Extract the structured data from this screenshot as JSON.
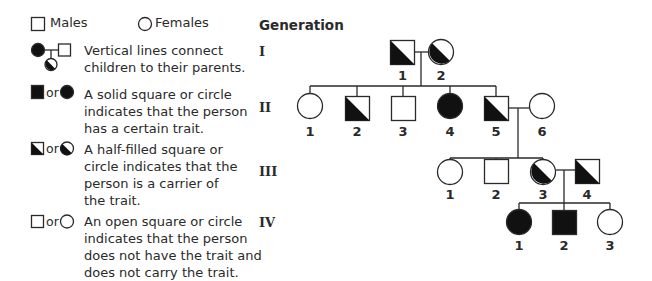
{
  "legend": {
    "males_label": "Males",
    "females_label": "Females",
    "or_text": "or",
    "items": [
      {
        "icon": "parent-child-line-icon",
        "lines": [
          "Vertical lines connect",
          "children to their parents."
        ]
      },
      {
        "icon": "solid-square-or-circle-icon",
        "lines": [
          "A solid square or circle",
          "indicates that the person",
          "has a certain trait."
        ]
      },
      {
        "icon": "half-filled-square-or-circle-icon",
        "lines": [
          "A half-filled square or",
          "circle indicates that the",
          "person is a carrier of",
          "the trait."
        ]
      },
      {
        "icon": "open-square-or-circle-icon",
        "lines": [
          "An open square or circle",
          "indicates that the person",
          "does not have the trait and",
          "does not carry the trait."
        ]
      }
    ]
  },
  "pedigree": {
    "title": "Generation",
    "colors": {
      "stroke": "#2a2a2a",
      "fill": "#111111"
    },
    "generations": [
      {
        "label": "I",
        "members": [
          {
            "id": "1",
            "sex": "male",
            "status": "carrier"
          },
          {
            "id": "2",
            "sex": "female",
            "status": "carrier"
          }
        ]
      },
      {
        "label": "II",
        "members": [
          {
            "id": "1",
            "sex": "female",
            "status": "unaffected"
          },
          {
            "id": "2",
            "sex": "male",
            "status": "carrier"
          },
          {
            "id": "3",
            "sex": "male",
            "status": "unaffected"
          },
          {
            "id": "4",
            "sex": "female",
            "status": "affected"
          },
          {
            "id": "5",
            "sex": "male",
            "status": "carrier"
          },
          {
            "id": "6",
            "sex": "female",
            "status": "unaffected"
          }
        ]
      },
      {
        "label": "III",
        "members": [
          {
            "id": "1",
            "sex": "female",
            "status": "unaffected"
          },
          {
            "id": "2",
            "sex": "male",
            "status": "unaffected"
          },
          {
            "id": "3",
            "sex": "female",
            "status": "carrier"
          },
          {
            "id": "4",
            "sex": "male",
            "status": "carrier"
          }
        ]
      },
      {
        "label": "IV",
        "members": [
          {
            "id": "1",
            "sex": "female",
            "status": "affected"
          },
          {
            "id": "2",
            "sex": "male",
            "status": "affected"
          },
          {
            "id": "3",
            "sex": "female",
            "status": "unaffected"
          }
        ]
      }
    ]
  }
}
